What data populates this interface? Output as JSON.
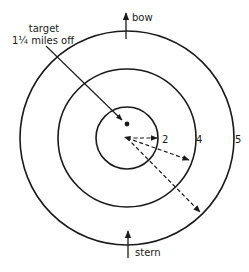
{
  "diagram": {
    "type": "radar-range-rings",
    "colors": {
      "ink": "#1a1a1a",
      "background": "#ffffff"
    },
    "rings": [
      {
        "label": "2",
        "radius_px": 31
      },
      {
        "label": "4",
        "radius_px": 69
      },
      {
        "label": "5",
        "radius_px": 107
      }
    ],
    "labels": {
      "bow": "bow",
      "stern": "stern",
      "target_line1": "target",
      "target_line2": "1¼ miles off",
      "ring_inner": "2",
      "ring_middle": "4",
      "ring_outer": "5"
    }
  }
}
